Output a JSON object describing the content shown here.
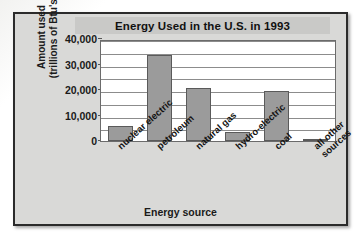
{
  "figure": {
    "title": "Energy Used in the U.S. in 1993",
    "x_axis_title": "Energy source",
    "y_axis_title_line1": "Amount used",
    "y_axis_title_line2": "(trillions of Btu's)",
    "frame_color": "#2b2b2b",
    "panel_color": "#d9d9d7",
    "bar_color": "#9b9b9b",
    "bar_border_color": "#5a5a5a",
    "plot_background": "#ffffff",
    "gridline_color": "#8c8c8c"
  },
  "chart_data": {
    "type": "bar",
    "title": "Energy Used in the U.S. in 1993",
    "xlabel": "Energy source",
    "ylabel": "Amount used (trillions of Btu's)",
    "categories": [
      "nuclear electric",
      "petroleum",
      "natural gas",
      "hydro-electric",
      "coal",
      "all other sources"
    ],
    "values": [
      6000,
      33800,
      20800,
      3500,
      19800,
      700
    ],
    "ylim": [
      0,
      40000
    ],
    "ytick_labels": [
      "40,000",
      "30,000",
      "20,000",
      "10,000",
      "0"
    ],
    "ytick_values": [
      40000,
      30000,
      20000,
      10000,
      0
    ],
    "minor_gridline_interval": 5000,
    "grid": true,
    "legend": "none",
    "xtick_rotation_degrees": -42
  }
}
